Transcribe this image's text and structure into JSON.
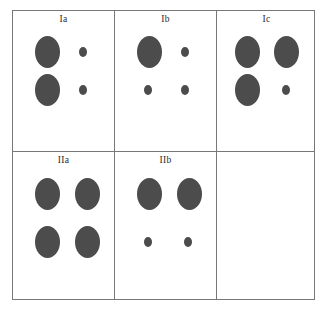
{
  "figure": {
    "type": "panel-grid",
    "columns": 3,
    "rows": 2,
    "background_color": "#ffffff",
    "border_color": "#777777",
    "blob_color": "#4c4c4c"
  },
  "panels": [
    {
      "id": "Ia",
      "label": "Ia",
      "row": 1,
      "column": 1,
      "empty": false,
      "shapes": [
        {
          "name": "blob-top-left",
          "size": "large",
          "x": 22,
          "y": 25,
          "w": 25,
          "h": 32
        },
        {
          "name": "blob-top-right",
          "size": "small",
          "x": 66,
          "y": 36,
          "w": 8,
          "h": 10
        },
        {
          "name": "blob-bottom-left",
          "size": "large",
          "x": 22,
          "y": 63,
          "w": 25,
          "h": 32
        },
        {
          "name": "blob-bottom-right",
          "size": "small",
          "x": 66,
          "y": 74,
          "w": 8,
          "h": 10
        }
      ]
    },
    {
      "id": "Ib",
      "label": "Ib",
      "row": 1,
      "column": 2,
      "empty": false,
      "shapes": [
        {
          "name": "blob-top-left",
          "size": "large",
          "x": 22,
          "y": 25,
          "w": 25,
          "h": 32
        },
        {
          "name": "blob-top-right",
          "size": "small",
          "x": 66,
          "y": 36,
          "w": 8,
          "h": 10
        },
        {
          "name": "blob-bottom-left",
          "size": "small",
          "x": 29,
          "y": 74,
          "w": 8,
          "h": 10
        },
        {
          "name": "blob-bottom-right",
          "size": "small",
          "x": 66,
          "y": 74,
          "w": 8,
          "h": 10
        }
      ]
    },
    {
      "id": "Ic",
      "label": "Ic",
      "row": 1,
      "column": 3,
      "empty": false,
      "shapes": [
        {
          "name": "blob-top-left",
          "size": "large",
          "x": 18,
          "y": 25,
          "w": 25,
          "h": 32
        },
        {
          "name": "blob-top-right",
          "size": "large",
          "x": 57,
          "y": 25,
          "w": 25,
          "h": 32
        },
        {
          "name": "blob-bottom-left",
          "size": "large",
          "x": 18,
          "y": 63,
          "w": 25,
          "h": 32
        },
        {
          "name": "blob-bottom-right",
          "size": "small",
          "x": 65,
          "y": 74,
          "w": 8,
          "h": 10
        }
      ]
    },
    {
      "id": "IIa",
      "label": "IIa",
      "row": 2,
      "column": 1,
      "empty": false,
      "shapes": [
        {
          "name": "blob-top-left",
          "size": "large",
          "x": 22,
          "y": 26,
          "w": 25,
          "h": 32
        },
        {
          "name": "blob-top-right",
          "size": "large",
          "x": 62,
          "y": 26,
          "w": 25,
          "h": 32
        },
        {
          "name": "blob-bottom-left",
          "size": "large",
          "x": 22,
          "y": 74,
          "w": 25,
          "h": 32
        },
        {
          "name": "blob-bottom-right",
          "size": "large",
          "x": 62,
          "y": 74,
          "w": 25,
          "h": 32
        }
      ]
    },
    {
      "id": "IIb",
      "label": "IIb",
      "row": 2,
      "column": 2,
      "empty": false,
      "shapes": [
        {
          "name": "blob-top-left",
          "size": "large",
          "x": 22,
          "y": 26,
          "w": 25,
          "h": 32
        },
        {
          "name": "blob-top-right",
          "size": "large",
          "x": 62,
          "y": 26,
          "w": 25,
          "h": 32
        },
        {
          "name": "blob-bottom-left",
          "size": "small",
          "x": 29,
          "y": 85,
          "w": 8,
          "h": 10
        },
        {
          "name": "blob-bottom-right",
          "size": "small",
          "x": 69,
          "y": 85,
          "w": 8,
          "h": 10
        }
      ]
    },
    {
      "id": "empty",
      "label": "",
      "row": 2,
      "column": 3,
      "empty": true,
      "shapes": []
    }
  ]
}
